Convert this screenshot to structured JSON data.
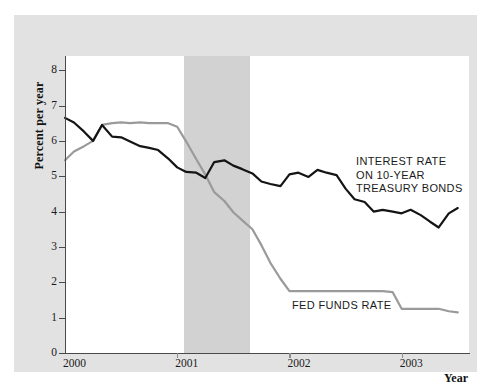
{
  "chart_data": {
    "type": "line",
    "title": "",
    "subtitle": "",
    "xlabel": "Year",
    "ylabel": "Percent per year",
    "xlim": [
      2000.0,
      2003.6
    ],
    "ylim": [
      0,
      8.4
    ],
    "yticks": [
      0,
      1,
      2,
      3,
      4,
      5,
      6,
      7,
      8
    ],
    "xticks": [
      2000,
      2001,
      2002,
      2003
    ],
    "xtick_labels": [
      "2000",
      "2001",
      "2002",
      "2003"
    ],
    "ytick_labels": [
      "0",
      "1",
      "2",
      "3",
      "4",
      "5",
      "6",
      "7",
      "8"
    ],
    "grid": false,
    "legend_position": "inline-annotation",
    "shaded_regions": [
      {
        "name": "recession-band",
        "x_start": 2001.06,
        "x_end": 2001.65,
        "color": "#d2d2d2",
        "label": ""
      }
    ],
    "series": [
      {
        "name": "INTEREST RATE ON 10-YEAR TREASURY BONDS",
        "short_name": "10-Year Treasury Bonds",
        "color": "#141414",
        "width": 2.2,
        "annotation": "INTEREST RATE\nON 10-YEAR\nTREASURY BONDS",
        "x": [
          2000.0,
          2000.08,
          2000.17,
          2000.25,
          2000.33,
          2000.42,
          2000.5,
          2000.58,
          2000.67,
          2000.75,
          2000.83,
          2000.92,
          2001.0,
          2001.08,
          2001.17,
          2001.25,
          2001.33,
          2001.42,
          2001.5,
          2001.58,
          2001.67,
          2001.75,
          2001.83,
          2001.92,
          2002.0,
          2002.08,
          2002.17,
          2002.25,
          2002.33,
          2002.42,
          2002.5,
          2002.58,
          2002.67,
          2002.75,
          2002.83,
          2002.92,
          2003.0,
          2003.08,
          2003.17,
          2003.25,
          2003.33,
          2003.42,
          2003.5
        ],
        "y": [
          6.65,
          6.52,
          6.26,
          6.0,
          6.45,
          6.12,
          6.1,
          5.98,
          5.85,
          5.8,
          5.74,
          5.5,
          5.25,
          5.12,
          5.1,
          4.95,
          5.4,
          5.45,
          5.3,
          5.2,
          5.08,
          4.85,
          4.78,
          4.72,
          5.05,
          5.1,
          4.98,
          5.18,
          5.1,
          5.03,
          4.65,
          4.35,
          4.27,
          4.0,
          4.05,
          4.0,
          3.95,
          4.05,
          3.9,
          3.72,
          3.55,
          3.95,
          4.1
        ]
      },
      {
        "name": "FED FUNDS RATE",
        "short_name": "Fed Funds Rate",
        "color": "#9a9a9a",
        "width": 2.2,
        "annotation": "FED FUNDS RATE",
        "x": [
          2000.0,
          2000.08,
          2000.17,
          2000.25,
          2000.33,
          2000.42,
          2000.5,
          2000.58,
          2000.67,
          2000.75,
          2000.83,
          2000.92,
          2001.0,
          2001.08,
          2001.17,
          2001.25,
          2001.33,
          2001.42,
          2001.5,
          2001.58,
          2001.67,
          2001.75,
          2001.83,
          2001.92,
          2002.0,
          2002.17,
          2002.42,
          2002.67,
          2002.83,
          2002.92,
          2003.0,
          2003.17,
          2003.33,
          2003.42,
          2003.5
        ],
        "y": [
          5.45,
          5.7,
          5.85,
          6.0,
          6.45,
          6.5,
          6.52,
          6.5,
          6.52,
          6.5,
          6.5,
          6.5,
          6.4,
          5.98,
          5.48,
          5.05,
          4.55,
          4.3,
          3.98,
          3.75,
          3.5,
          3.05,
          2.55,
          2.1,
          1.75,
          1.75,
          1.75,
          1.75,
          1.75,
          1.72,
          1.25,
          1.25,
          1.25,
          1.18,
          1.15
        ]
      }
    ]
  },
  "axes": {
    "y_title": "Percent per year",
    "x_title": "Year"
  },
  "annotations": {
    "treasury_line1": "INTEREST RATE",
    "treasury_line2": "ON 10-YEAR",
    "treasury_line3": "TREASURY BONDS",
    "fedfunds": "FED FUNDS RATE"
  },
  "colors": {
    "figure_background": "#e2e2e2",
    "plot_background": "#ffffff",
    "recession_band": "#d2d2d2",
    "treasury_line": "#141414",
    "fedfunds_line": "#9a9a9a",
    "axis": "#4a4a4a",
    "text": "#1a1a1a"
  }
}
